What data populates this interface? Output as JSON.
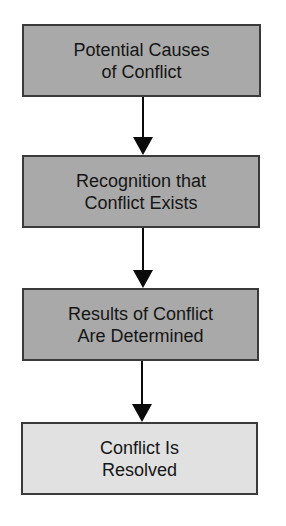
{
  "diagram": {
    "type": "flowchart",
    "direction": "top-to-bottom",
    "colors": {
      "stage_fill": "#a9a9a9",
      "final_fill": "#e1e1e1",
      "border": "#3a3a3a",
      "arrow": "#0a0a0a",
      "text": "#151515"
    },
    "nodes": [
      {
        "id": "causes",
        "label": "Potential Causes\nof Conflict"
      },
      {
        "id": "recognition",
        "label": "Recognition that\nConflict Exists"
      },
      {
        "id": "results",
        "label": "Results of Conflict\nAre Determined"
      },
      {
        "id": "resolved",
        "label": "Conflict Is\nResolved"
      }
    ],
    "edges": [
      {
        "from": "causes",
        "to": "recognition"
      },
      {
        "from": "recognition",
        "to": "results"
      },
      {
        "from": "results",
        "to": "resolved"
      }
    ]
  }
}
